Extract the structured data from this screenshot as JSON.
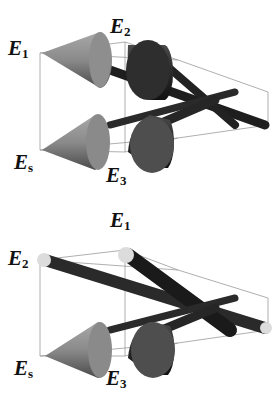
{
  "figure": {
    "panels": [
      {
        "id": "top",
        "labels": {
          "e1": {
            "main": "E",
            "sub": "1"
          },
          "e2": {
            "main": "E",
            "sub": "2"
          },
          "es": {
            "main": "E",
            "sub": "s"
          },
          "e3": {
            "main": "E",
            "sub": "3"
          }
        }
      },
      {
        "id": "bottom",
        "labels": {
          "e1": {
            "main": "E",
            "sub": "1"
          },
          "e2": {
            "main": "E",
            "sub": "2"
          },
          "es": {
            "main": "E",
            "sub": "s"
          },
          "e3": {
            "main": "E",
            "sub": "3"
          }
        }
      }
    ],
    "colors": {
      "box_edge": "#9a9a9a",
      "light_cone": "#8a8a8a",
      "dark_rod": "#2a2a2a",
      "end_cap": "#dcdcdc"
    }
  }
}
